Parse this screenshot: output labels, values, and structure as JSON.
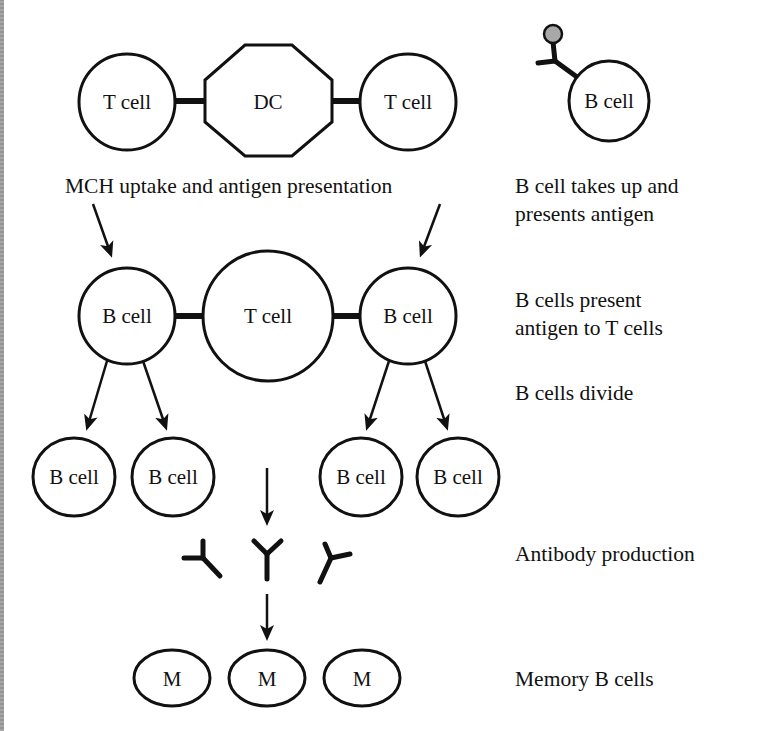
{
  "diagram": {
    "row1": {
      "left_t_cell": "T cell",
      "dendritic_cell": "DC",
      "right_t_cell": "T cell",
      "caption": "MCH uptake and antigen presentation",
      "b_cell_with_antigen": "B cell"
    },
    "row2": {
      "left_b_cell": "B cell",
      "center_t_cell": "T cell",
      "right_b_cell": "B cell"
    },
    "row3": {
      "b_cells": [
        "B cell",
        "B cell",
        "B cell",
        "B cell"
      ]
    },
    "memory_cells": [
      "M",
      "M",
      "M"
    ],
    "side_labels": {
      "step1_line1": "B cell takes up and",
      "step1_line2": "presents antigen",
      "step2_line1": "B cells present",
      "step2_line2": "antigen to T cells",
      "step3": "B cells divide",
      "step4": "Antibody production",
      "step5": "Memory B cells"
    },
    "colors": {
      "stroke": "#111111",
      "antigen_fill": "#a8a8a8",
      "background": "#ffffff"
    }
  }
}
